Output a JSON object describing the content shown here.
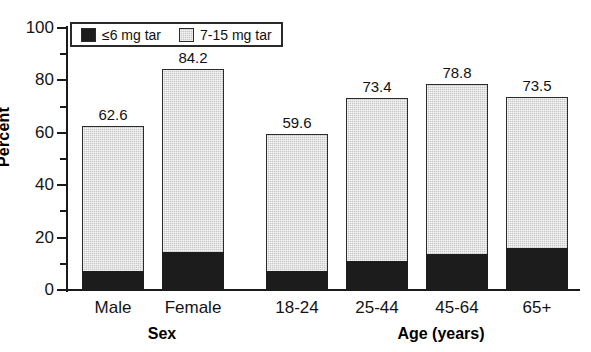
{
  "top_clipped_text": "",
  "legend": {
    "position": "top-left-inside",
    "items": [
      {
        "label": "≤6 mg tar",
        "swatch": "dark",
        "color": "#1c1c1c"
      },
      {
        "label": "7-15 mg tar",
        "swatch": "light",
        "color": "#c8c8c8"
      }
    ]
  },
  "axes": {
    "y_title": "Percent",
    "y_ticks": [
      "0",
      "20",
      "40",
      "60",
      "80",
      "100"
    ],
    "y_minor_ticks": [
      "10",
      "30",
      "50",
      "70",
      "90"
    ]
  },
  "groups": [
    {
      "title": "Sex",
      "categories": [
        "Male",
        "Female"
      ]
    },
    {
      "title": "Age (years)",
      "categories": [
        "18-24",
        "25-44",
        "45-64",
        "65+"
      ]
    }
  ],
  "chart_data": {
    "type": "bar",
    "subtype": "stacked",
    "title": "",
    "xlabel": "",
    "ylabel": "Percent",
    "ylim": [
      0,
      100
    ],
    "ytick_step": 20,
    "yminor_tick_step": 10,
    "grid": false,
    "legend_position": "upper left (inside plot)",
    "categories": [
      "Male",
      "Female",
      "18-24",
      "25-44",
      "45-64",
      "65+"
    ],
    "group_labels": [
      "Sex",
      "Sex",
      "Age (years)",
      "Age (years)",
      "Age (years)",
      "Age (years)"
    ],
    "series": [
      {
        "name": "≤6 mg tar",
        "color": "#1c1c1c",
        "values": [
          6.9,
          14.1,
          6.9,
          10.7,
          13.4,
          15.6
        ]
      },
      {
        "name": "7-15 mg tar",
        "color": "#c8c8c8",
        "values": [
          55.7,
          70.1,
          52.7,
          62.7,
          65.4,
          57.9
        ]
      }
    ],
    "totals": [
      62.6,
      84.2,
      59.6,
      73.4,
      78.8,
      73.5
    ],
    "total_labels": [
      "62.6",
      "84.2",
      "59.6",
      "73.4",
      "78.8",
      "73.5"
    ]
  },
  "bar_layout": [
    {
      "key": "male",
      "x": 16,
      "w": 62,
      "group": 0
    },
    {
      "key": "female",
      "x": 96,
      "w": 62,
      "group": 0
    },
    {
      "key": "a18",
      "x": 200,
      "w": 62,
      "group": 1
    },
    {
      "key": "a25",
      "x": 280,
      "w": 62,
      "group": 1
    },
    {
      "key": "a45",
      "x": 360,
      "w": 62,
      "group": 1
    },
    {
      "key": "a65",
      "x": 440,
      "w": 62,
      "group": 1
    }
  ],
  "group_title_x": [
    96,
    375
  ]
}
